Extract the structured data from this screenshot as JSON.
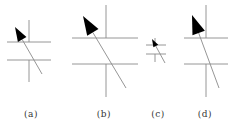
{
  "figure": {
    "colors": {
      "line": "#8a8a8a",
      "arrow": "#000000",
      "background": "#ffffff"
    },
    "panels": [
      {
        "label": "(a)",
        "label_x": 31,
        "vertical_top": {
          "x": 29,
          "y1": 20,
          "y2": 42
        },
        "vertical_bottom": {
          "x": 29,
          "y1": 60,
          "y2": 82
        },
        "upper_horizontal": {
          "x1": 7,
          "x2": 51,
          "y": 42
        },
        "lower_horizontal": {
          "x1": 7,
          "x2": 51,
          "y": 60
        },
        "arrow": {
          "tip": [
            15,
            27
          ],
          "tail": [
            42,
            74
          ],
          "head_size": 9
        }
      },
      {
        "label": "(b)",
        "label_x": 104,
        "vertical_top": {
          "x": 106,
          "y1": 5,
          "y2": 38
        },
        "vertical_bottom": {
          "x": 106,
          "y1": 64,
          "y2": 97
        },
        "upper_horizontal": {
          "x1": 72,
          "x2": 138,
          "y": 38
        },
        "lower_horizontal": {
          "x1": 72,
          "x2": 138,
          "y": 64
        },
        "arrow": {
          "tip": [
            83,
            16
          ],
          "tail": [
            126,
            88
          ],
          "head_size": 12
        }
      },
      {
        "label": "(c)",
        "label_x": 158,
        "vertical_top": {
          "x": 155,
          "y1": 38,
          "y2": 45
        },
        "vertical_bottom": {
          "x": 155,
          "y1": 54,
          "y2": 62
        },
        "upper_horizontal": {
          "x1": 146,
          "x2": 166,
          "y": 45
        },
        "lower_horizontal": {
          "x1": 146,
          "x2": 166,
          "y": 54
        },
        "arrow": {
          "tip": [
            152,
            39
          ],
          "tail": [
            165,
            63
          ],
          "head_size": 5
        }
      },
      {
        "label": "(d)",
        "label_x": 205,
        "vertical_top": {
          "x": 206,
          "y1": 5,
          "y2": 38
        },
        "vertical_bottom": {
          "x": 206,
          "y1": 64,
          "y2": 97
        },
        "upper_horizontal": {
          "x1": 184,
          "x2": 228,
          "y": 38
        },
        "lower_horizontal": {
          "x1": 184,
          "x2": 228,
          "y": 64
        },
        "arrow": {
          "tip": [
            192,
            15
          ],
          "tail": [
            219,
            88
          ],
          "head_size": 12
        }
      }
    ]
  }
}
